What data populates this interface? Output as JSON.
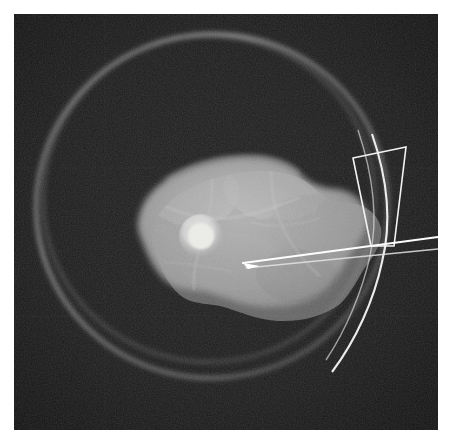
{
  "viewer": {
    "name": "grayscale-radiographic-scan",
    "modality_appearance": "x-ray / tomographic slice",
    "canvas_width": 452,
    "canvas_height": 444,
    "page_background": "#ffffff",
    "border_margin_px": 14
  },
  "image_field": {
    "label": "scan field",
    "x": 14,
    "y": 14,
    "width": 424,
    "height": 416,
    "background_color": "#191919",
    "corner_color": "#131313",
    "grain": "fine speckle noise"
  },
  "rings": {
    "label": "concentric specimen container arcs",
    "color": "#8e8e8e",
    "items": [
      {
        "name": "outer-ring",
        "cx": 212,
        "cy": 206,
        "rx": 176,
        "ry": 172,
        "stroke_width": 3.2,
        "opacity": 0.62,
        "rotation": -6
      },
      {
        "name": "inner-ring",
        "cx": 209,
        "cy": 199,
        "rx": 166,
        "ry": 163,
        "stroke_width": 2.4,
        "opacity": 0.45,
        "rotation": -4
      }
    ]
  },
  "specimen": {
    "label": "soft tissue specimen mass",
    "fill_mid": "#9b9b9b",
    "fill_light": "#bdbdbd",
    "fill_dark": "#6f6f6f",
    "centroid_x": 236,
    "centroid_y": 232,
    "approx_width": 246,
    "approx_height": 140,
    "outline_points": "138,222 142,204 152,190 170,176 196,166 224,160 252,158 274,162 290,172 300,186 312,190 330,190 348,196 362,208 366,222 360,238 352,250 344,262 336,276 322,290 300,300 274,306 252,304 232,296 214,292 196,294 180,290 166,278 156,262 148,244 140,232",
    "texture_note": "mottled lobular parenchyma with branching septal lines"
  },
  "nodule": {
    "label": "hyperdense focal nodule",
    "cx": 201,
    "cy": 236,
    "r": 14,
    "color": "#e8e8e4",
    "halo_color": "#c9c9c5"
  },
  "needle": {
    "label": "biopsy needle / probe",
    "color": "#fdfdfd",
    "tip_x": 243,
    "tip_y": 263,
    "entry_x": 424,
    "entry_y": 237,
    "shaft_width": 2.2,
    "secondary_edge": "lower echo shadow line",
    "secondary_tip_x": 246,
    "secondary_tip_y": 268,
    "secondary_entry_x": 424,
    "secondary_entry_y": 249
  },
  "roi_overlay": {
    "label": "quadrilateral region-of-interest marker",
    "color": "#f2f2f2",
    "stroke_width": 1.6,
    "vertices": [
      {
        "name": "top-left",
        "x": 353,
        "y": 158
      },
      {
        "name": "top-right",
        "x": 406,
        "y": 147
      },
      {
        "name": "bottom-right",
        "x": 394,
        "y": 246
      },
      {
        "name": "bottom-left",
        "x": 371,
        "y": 246
      }
    ]
  },
  "guide_curves": {
    "label": "bright overlay guide arcs",
    "color": "#f6f6f6",
    "items": [
      {
        "name": "guide-arc-outer",
        "path": "M 372 134 C 388 180, 392 222, 382 262 C 374 300, 356 340, 332 372",
        "stroke_width": 2.2,
        "opacity": 0.95
      },
      {
        "name": "guide-arc-inner",
        "path": "M 358 130 C 374 178, 378 220, 370 256 C 362 292, 346 330, 326 360",
        "stroke_width": 1.5,
        "opacity": 0.7
      }
    ]
  },
  "faint_crosshair": {
    "label": "faint reference grid lines",
    "color": "#2a2a2a",
    "horizontal_y": [
      168,
      316
    ],
    "vertical_x": [
      105
    ]
  }
}
